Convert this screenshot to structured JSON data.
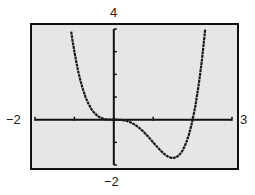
{
  "chart_data": {
    "type": "line",
    "title": "",
    "xlabel": "",
    "ylabel": "",
    "xlim": [
      -2,
      3
    ],
    "ylim": [
      -2,
      4
    ],
    "x_ticks": [
      -2,
      -1,
      0,
      1,
      2,
      3
    ],
    "y_ticks": [
      -2,
      -1,
      0,
      1,
      2,
      3,
      4
    ],
    "grid": false,
    "legend": null,
    "series": [
      {
        "name": "f(x) = x^4 - 2x^3",
        "x": [
          -1.1,
          -1.0,
          -0.8,
          -0.6,
          -0.4,
          -0.2,
          0.0,
          0.2,
          0.4,
          0.6,
          0.8,
          1.0,
          1.2,
          1.4,
          1.5,
          1.6,
          1.8,
          2.0,
          2.2,
          2.35
        ],
        "values": [
          4.12,
          3.0,
          1.43,
          0.56,
          0.15,
          0.02,
          0.0,
          -0.01,
          -0.1,
          -0.3,
          -0.61,
          -1.0,
          -1.38,
          -1.65,
          -1.69,
          -1.64,
          -1.17,
          0.0,
          2.13,
          4.54
        ]
      }
    ],
    "annotations": {
      "x_min_label": "−2",
      "x_max_label": "3",
      "y_max_label": "4",
      "y_min_label": "−2"
    },
    "colors": {
      "background": "#e6e6e6",
      "curve": "#1a1a1a",
      "axes": "#111111",
      "frame": "#111111"
    }
  },
  "labels": {
    "x_min": "−2",
    "x_max": "3",
    "y_max": "4",
    "y_min": "−2"
  }
}
